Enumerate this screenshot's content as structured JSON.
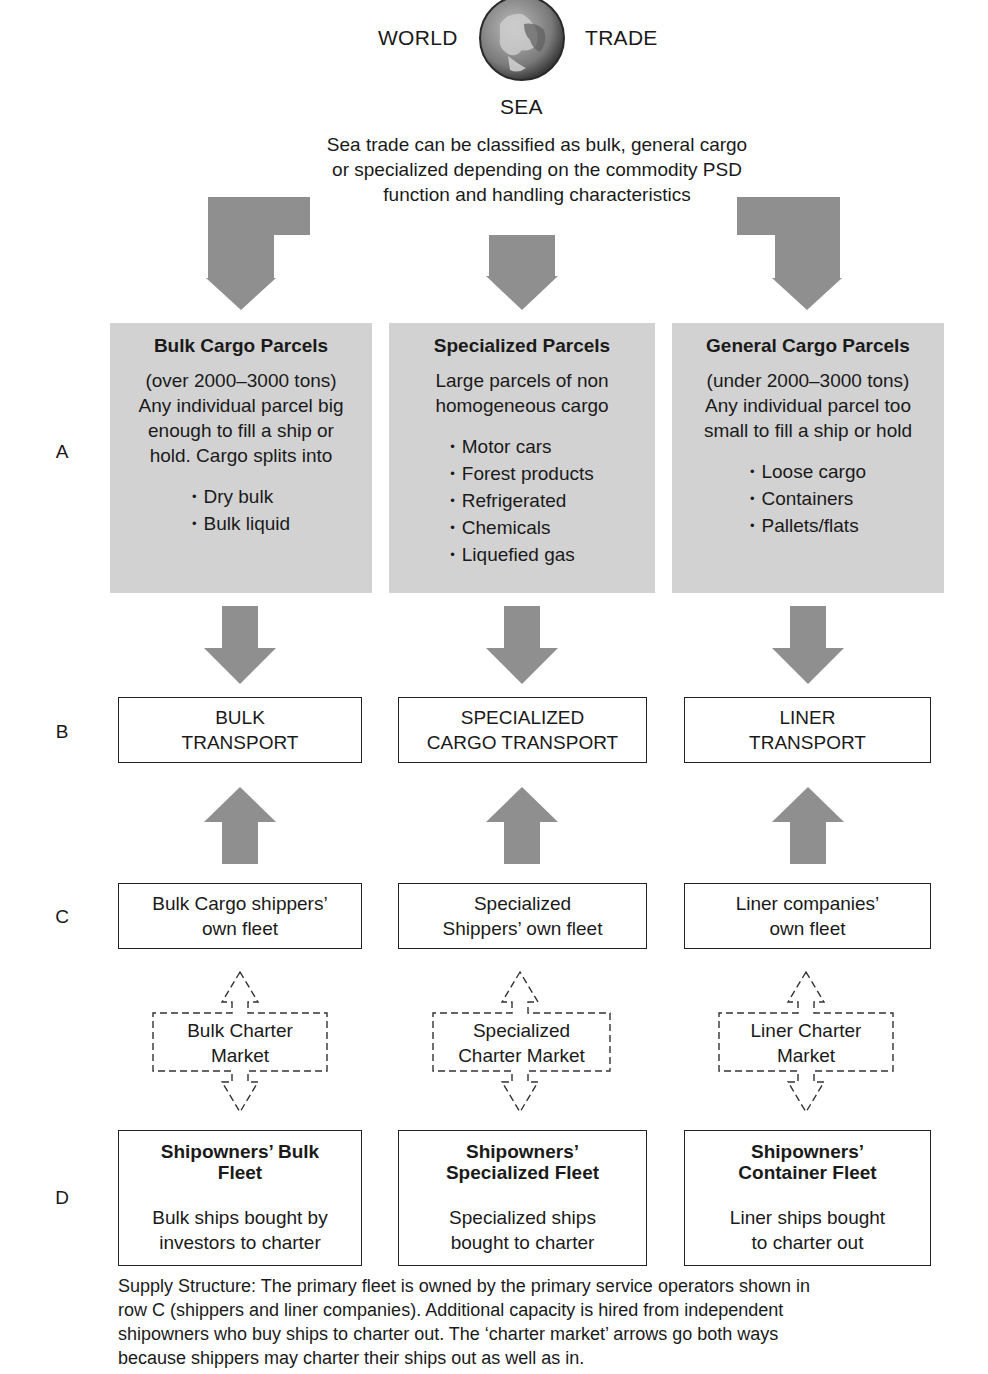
{
  "header": {
    "word_left": "WORLD",
    "word_right": "TRADE",
    "word_bottom": "SEA",
    "globe_icon": "globe-icon",
    "intro_lines": [
      "Sea trade can be classified as bulk, general cargo",
      "or specialized depending on the commodity PSD",
      "function and handling characteristics"
    ]
  },
  "row_labels": {
    "a": "A",
    "b": "B",
    "c": "C",
    "d": "D"
  },
  "row_a": [
    {
      "title": "Bulk Cargo Parcels",
      "desc_lines": [
        "(over 2000–3000 tons)",
        "Any individual parcel big",
        "enough to fill a ship or",
        "hold. Cargo splits into"
      ],
      "items": [
        "Dry bulk",
        "Bulk liquid"
      ]
    },
    {
      "title": "Specialized Parcels",
      "desc_lines": [
        "Large parcels of non",
        "homogeneous cargo"
      ],
      "items": [
        "Motor cars",
        "Forest products",
        "Refrigerated",
        "Chemicals",
        "Liquefied gas"
      ]
    },
    {
      "title": "General Cargo Parcels",
      "desc_lines": [
        "(under 2000–3000 tons)",
        "Any individual parcel too",
        "small to fill a ship or hold"
      ],
      "items": [
        "Loose cargo",
        "Containers",
        "Pallets/flats"
      ]
    }
  ],
  "row_b": [
    {
      "lines": [
        "BULK",
        "TRANSPORT"
      ]
    },
    {
      "lines": [
        "SPECIALIZED",
        "CARGO TRANSPORT"
      ]
    },
    {
      "lines": [
        "LINER",
        "TRANSPORT"
      ]
    }
  ],
  "row_c": [
    {
      "lines": [
        "Bulk Cargo shippers’",
        "own fleet"
      ]
    },
    {
      "lines": [
        "Specialized",
        "Shippers’ own fleet"
      ]
    },
    {
      "lines": [
        "Liner companies’",
        "own fleet"
      ]
    }
  ],
  "charter": [
    {
      "lines": [
        "Bulk Charter",
        "Market"
      ]
    },
    {
      "lines": [
        "Specialized",
        "Charter Market"
      ]
    },
    {
      "lines": [
        "Liner Charter",
        "Market"
      ]
    }
  ],
  "row_d": [
    {
      "title_lines": [
        "Shipowners’ Bulk",
        "Fleet"
      ],
      "body_lines": [
        "Bulk ships bought by",
        "investors to charter"
      ]
    },
    {
      "title_lines": [
        "Shipowners’",
        "Specialized Fleet"
      ],
      "body_lines": [
        "Specialized ships",
        "bought to charter"
      ]
    },
    {
      "title_lines": [
        "Shipowners’",
        "Container Fleet"
      ],
      "body_lines": [
        "Liner ships bought",
        "to charter out"
      ]
    }
  ],
  "caption_lines": [
    "Supply Structure: The primary fleet is owned by the primary service operators shown in",
    "row C (shippers and liner companies). Additional capacity is hired from independent",
    "shipowners who buy ships to charter out. The ‘charter market’ arrows go both ways",
    "because shippers may charter their ships out as well as in."
  ],
  "colors": {
    "arrow_gray": "#8f8f8f",
    "panel_gray": "#d2d2d2",
    "line": "#222222",
    "text": "#1a1a1a"
  }
}
